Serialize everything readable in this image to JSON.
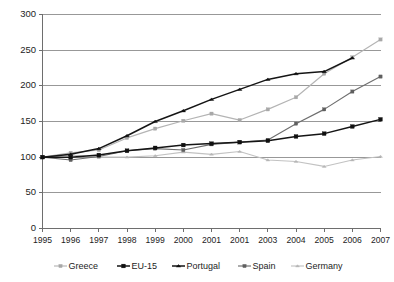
{
  "chart_data": {
    "type": "line",
    "title": "",
    "subtitle": "",
    "xlabel": "",
    "ylabel": "",
    "ylim": [
      0,
      300
    ],
    "yticks": [
      0,
      50,
      100,
      150,
      200,
      250,
      300
    ],
    "ytick_labels": [
      "0",
      "50",
      "100",
      "150",
      "200",
      "250",
      "300"
    ],
    "grid": true,
    "grid_axis": "y",
    "legend_position": "bottom",
    "categories": [
      "1995",
      "1996",
      "1997",
      "1998",
      "1999",
      "2000",
      "2001",
      "2001",
      "2003",
      "2004",
      "2005",
      "2006",
      "2007"
    ],
    "series": [
      {
        "name": "Greece",
        "color": "#b4b4b4",
        "marker": "square",
        "marker_color": "#a8a8a8",
        "values": [
          100,
          106,
          110,
          127,
          140,
          151,
          161,
          152,
          167,
          184,
          217,
          240,
          265
        ]
      },
      {
        "name": "EU-15",
        "color": "#151515",
        "marker": "square",
        "marker_color": "#101010",
        "values": [
          100,
          100,
          103,
          109,
          113,
          117,
          119,
          121,
          123,
          129,
          133,
          143,
          153
        ]
      },
      {
        "name": "Portugal",
        "color": "#151515",
        "marker": "triangle",
        "marker_color": "#101010",
        "values": [
          100,
          104,
          112,
          130,
          150,
          165,
          181,
          195,
          209,
          217,
          220,
          239,
          null
        ]
      },
      {
        "name": "Spain",
        "color": "#6e6e6e",
        "marker": "square",
        "marker_color": "#5f5f5f",
        "values": [
          100,
          96,
          101,
          109,
          112,
          110,
          118,
          121,
          124,
          147,
          167,
          192,
          213
        ]
      },
      {
        "name": "Germany",
        "color": "#c2c2c2",
        "marker": "triangle",
        "marker_color": "#b6b6b6",
        "values": [
          100,
          103,
          100,
          100,
          102,
          107,
          104,
          108,
          96,
          94,
          87,
          96,
          101
        ]
      }
    ]
  },
  "legend": {
    "items": [
      {
        "label": "Greece"
      },
      {
        "label": "EU-15"
      },
      {
        "label": "Portugal"
      },
      {
        "label": "Spain"
      },
      {
        "label": "Germany"
      }
    ]
  },
  "axes": {
    "y_max_label": "300",
    "y_min_label": "0"
  }
}
